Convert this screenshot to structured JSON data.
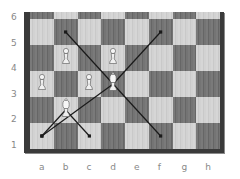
{
  "diagram": {
    "type": "chess-board",
    "ranks_visible": [
      "6",
      "5",
      "4",
      "3",
      "2",
      "1"
    ],
    "files": [
      "a",
      "b",
      "c",
      "d",
      "e",
      "f",
      "g",
      "h"
    ],
    "pieces": [
      {
        "square": "b4",
        "piece": "white-pawn"
      },
      {
        "square": "d4",
        "piece": "white-pawn"
      },
      {
        "square": "a3",
        "piece": "white-pawn"
      },
      {
        "square": "c3",
        "piece": "white-pawn"
      },
      {
        "square": "d3",
        "piece": "white-bishop"
      },
      {
        "square": "b2",
        "piece": "white-bishop"
      }
    ],
    "arrows": [
      {
        "from": "d3",
        "to": "b5"
      },
      {
        "from": "d3",
        "to": "f5"
      },
      {
        "from": "d3",
        "to": "a1"
      },
      {
        "from": "d3",
        "to": "f1"
      },
      {
        "from": "b2",
        "to": "a1"
      },
      {
        "from": "b2",
        "to": "c1"
      }
    ],
    "colors": {
      "light_square": "#d2d2d2",
      "dark_square": "#717171",
      "frame": "#3a3a3a",
      "arrow": "#1a1a1a",
      "label": "#888888"
    }
  }
}
